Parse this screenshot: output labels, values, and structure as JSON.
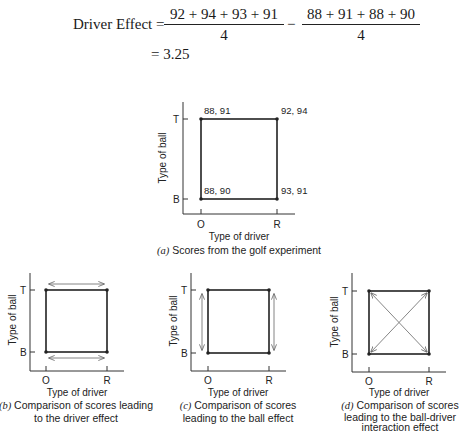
{
  "equation": {
    "label": "Driver Effect =",
    "fraction1": {
      "numerator": "92 + 94 + 93 + 91",
      "denominator": "4"
    },
    "operator": "−",
    "fraction2": {
      "numerator": "88 + 91 + 88 + 90",
      "denominator": "4"
    },
    "result": "= 3.25"
  },
  "axes": {
    "x_label": "Type of driver",
    "y_label": "Type of ball",
    "x_ticks": [
      "O",
      "R"
    ],
    "y_ticks": [
      "T",
      "B"
    ]
  },
  "panels": {
    "a": {
      "caption_letter": "(a)",
      "caption_text": " Scores from the golf experiment",
      "points": {
        "O_T": "88, 91",
        "R_T": "92, 94",
        "O_B": "88, 90",
        "R_B": "93, 91"
      }
    },
    "b": {
      "caption_letter": "(b)",
      "caption_line1": " Comparison of scores leading",
      "caption_line2": "to the driver effect",
      "arrows": "horizontal"
    },
    "c": {
      "caption_letter": "(c)",
      "caption_line1": " Comparison of scores",
      "caption_line2": "leading to the ball effect",
      "arrows": "vertical"
    },
    "d": {
      "caption_letter": "(d)",
      "caption_line1": " Comparison of scores",
      "caption_line2": "leading to the ball-driver",
      "caption_line3": "interaction effect",
      "arrows": "diagonal"
    }
  },
  "colors": {
    "line": "#222222",
    "arrow": "#777777",
    "background": "#ffffff"
  }
}
